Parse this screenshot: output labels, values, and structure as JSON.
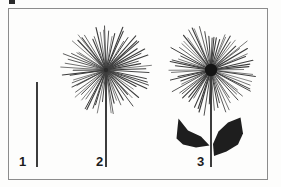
{
  "figure": {
    "kind": "botanical-line-diagram",
    "caption_labels": [
      "1",
      "2",
      "3"
    ],
    "background_color": "#fdfdfc",
    "ink_color": "#1c1c1c",
    "ray_color": "#3b3b3b",
    "frame_color": "#8c8c8c",
    "artifact": {
      "name": "scan-artifact",
      "visible": true
    },
    "specimens": [
      {
        "id": "1",
        "label": "1",
        "stage": "bare stem",
        "stem": {
          "x": 37,
          "y_top": 82,
          "y_bottom": 167,
          "width": 2
        },
        "head": null,
        "leaves": [],
        "label_pos": {
          "x": 19,
          "y": 155
        }
      },
      {
        "id": "2",
        "label": "2",
        "stage": "radiate head on stem",
        "stem": {
          "x": 106,
          "y_top": 70,
          "y_bottom": 167,
          "width": 2
        },
        "head": {
          "cx": 106,
          "cy": 70,
          "radius": 45,
          "ray_count": 72,
          "center_disc_radius": 2,
          "center_fill": "#2b2b2b"
        },
        "leaves": [],
        "label_pos": {
          "x": 96,
          "y": 155
        }
      },
      {
        "id": "3",
        "label": "3",
        "stage": "radiate head with paired leaves",
        "stem": {
          "x": 211,
          "y_top": 70,
          "y_bottom": 167,
          "width": 2
        },
        "head": {
          "cx": 211,
          "cy": 70,
          "radius": 45,
          "ray_count": 72,
          "center_disc_radius": 6,
          "center_fill": "#151515"
        },
        "leaves": [
          {
            "side": "left",
            "fill": "#1e1e1e"
          },
          {
            "side": "right",
            "fill": "#1e1e1e"
          }
        ],
        "label_pos": {
          "x": 197,
          "y": 155
        }
      }
    ]
  }
}
